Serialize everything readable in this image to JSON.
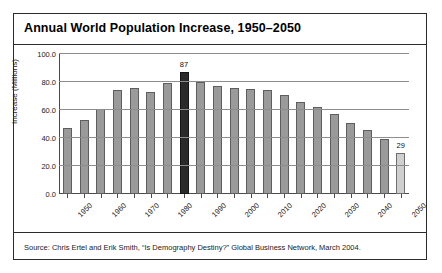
{
  "figure": {
    "title": "Annual World Population Increase, 1950–2050",
    "source": "Source: Chris Ertel and Erik Smith, “Is Demography Destiny?” Global Business Network, March 2004."
  },
  "chart_data": {
    "type": "bar",
    "title": "Annual World Population Increase, 1950–2050",
    "xlabel": "",
    "ylabel": "Increase (Millions)",
    "ylim": [
      0,
      100
    ],
    "yticks": [
      "0.0",
      "20.0",
      "40.0",
      "60.0",
      "80.0",
      "100.0"
    ],
    "ytick_values": [
      0,
      20,
      40,
      60,
      80,
      100
    ],
    "grid": true,
    "legend": "none",
    "categories": [
      "1950",
      "1955",
      "1960",
      "1965",
      "1970",
      "1975",
      "1980",
      "1985",
      "1990",
      "1995",
      "2000",
      "2005",
      "2010",
      "2015",
      "2020",
      "2025",
      "2030",
      "2035",
      "2040",
      "2045",
      "2050"
    ],
    "xtick_labels": [
      "1950",
      "1960",
      "1970",
      "1980",
      "1990",
      "2000",
      "2010",
      "2020",
      "2030",
      "2040",
      "2050"
    ],
    "values": [
      47,
      53,
      61,
      74,
      76,
      73,
      79,
      87,
      80,
      77,
      76,
      75,
      74,
      71,
      66,
      62,
      57,
      51,
      46,
      39,
      29
    ],
    "annotations": [
      {
        "category": "1985",
        "label": "87",
        "value": 87
      },
      {
        "category": "2050",
        "label": "29",
        "value": 29
      }
    ],
    "bar_styles": [
      "normal",
      "normal",
      "normal",
      "normal",
      "normal",
      "normal",
      "normal",
      "highlight",
      "normal",
      "normal",
      "normal",
      "normal",
      "normal",
      "normal",
      "normal",
      "normal",
      "normal",
      "normal",
      "normal",
      "normal",
      "projected"
    ],
    "colors": {
      "bar": "#9a9a9a",
      "bar_highlight": "#2a2a2a",
      "bar_projected": "#cfcfcf",
      "grid": "#8d8d8d",
      "axis": "#4a4a4a",
      "text": "#111111"
    }
  }
}
